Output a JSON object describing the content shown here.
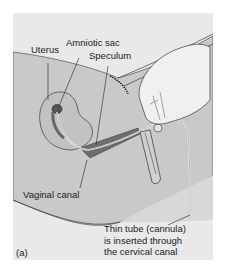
{
  "figure": {
    "panel_label": "(a)",
    "labels": {
      "uterus": "Uterus",
      "amniotic_sac": "Amniotic sac",
      "speculum": "Speculum",
      "vaginal_canal": "Vaginal canal"
    },
    "caption": {
      "line1": "Thin tube (cannula)",
      "line2": "is inserted through",
      "line3": "the cervical canal"
    },
    "colors": {
      "background": "#e9e9e9",
      "body": "#c9c9c9",
      "body_dark": "#b7b7b7",
      "canal": "#6e6e6e",
      "outline": "#3a3a3a",
      "hand": "#f0f0f0"
    }
  }
}
